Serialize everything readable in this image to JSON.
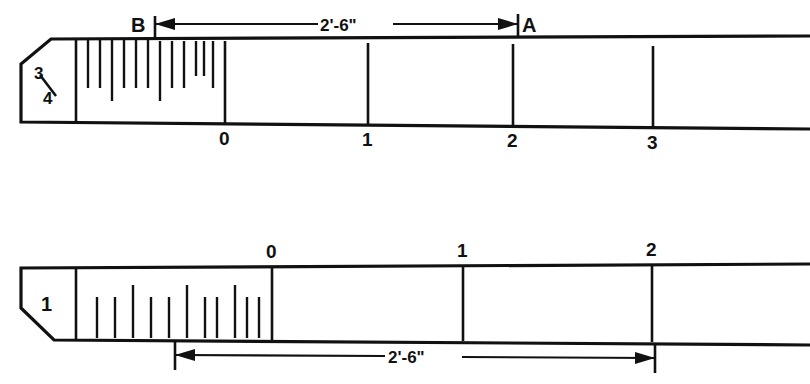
{
  "figure": {
    "type": "technical-diagram",
    "background_color": "#ffffff",
    "ink_color": "#111111"
  },
  "top_scale": {
    "id_label": "3/4",
    "id_numerator": "3",
    "id_denominator": "4",
    "fraction_separator": "/",
    "direction": "left-to-right",
    "whole_numbers": [
      "0",
      "1",
      "2",
      "3"
    ],
    "fractional_zone_label": "",
    "subdivision_tick_count": 12,
    "point_start_label": "B",
    "point_end_label": "A",
    "dimension_text": "2'-6\"",
    "dimension_value_feet": 2,
    "dimension_value_inches": 6
  },
  "bottom_scale": {
    "id_label": "1",
    "direction": "left-to-right",
    "whole_numbers": [
      "0",
      "1",
      "2"
    ],
    "subdivision_tick_count": 11,
    "dimension_text": "2'-6\"",
    "dimension_value_feet": 2,
    "dimension_value_inches": 6
  },
  "annotations": {
    "top_dimension_label": "2'-6\"",
    "bottom_dimension_label": "2'-6\"",
    "point_a": "A",
    "point_b": "B"
  }
}
